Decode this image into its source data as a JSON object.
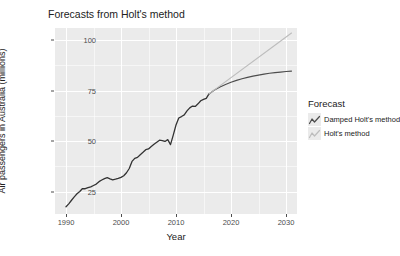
{
  "chart_data": {
    "type": "line",
    "title": "Forecasts from Holt's method",
    "xlabel": "Year",
    "ylabel": "Air passengers in Australia (millions)",
    "xlim": [
      1988,
      2032
    ],
    "ylim": [
      14,
      106
    ],
    "xticks": [
      1990,
      2000,
      2010,
      2020,
      2030
    ],
    "yticks": [
      25,
      50,
      75,
      100
    ],
    "grid": true,
    "legend_title": "Forecast",
    "legend_position": "right",
    "series": [
      {
        "name": "Historical data",
        "color": "#333333",
        "x": [
          1990,
          1990.5,
          1991,
          1991.5,
          1992,
          1992.5,
          1993,
          1993.5,
          1994,
          1994.5,
          1995,
          1995.5,
          1996,
          1996.5,
          1997,
          1997.5,
          1998,
          1998.5,
          1999,
          1999.5,
          2000,
          2000.5,
          2001,
          2001.5,
          2002,
          2002.5,
          2003,
          2003.5,
          2004,
          2004.5,
          2005,
          2005.5,
          2006,
          2006.5,
          2007,
          2007.5,
          2008,
          2008.5,
          2009,
          2009.5,
          2010,
          2010.5,
          2011,
          2011.5,
          2012,
          2012.5,
          2013,
          2013.5,
          2014,
          2014.5,
          2015,
          2015.5,
          2016
        ],
        "y": [
          17.6,
          19.0,
          20.8,
          22.5,
          24.0,
          25.1,
          26.6,
          26.5,
          27.0,
          27.4,
          28.1,
          28.8,
          30.0,
          30.8,
          31.5,
          32.0,
          31.4,
          30.9,
          31.2,
          31.6,
          32.1,
          32.9,
          34.4,
          36.5,
          40.0,
          41.5,
          42.0,
          43.3,
          44.5,
          45.8,
          46.2,
          47.4,
          48.5,
          49.5,
          50.5,
          50.3,
          49.9,
          50.8,
          48.3,
          53.0,
          58.0,
          61.5,
          62.2,
          63.0,
          65.0,
          66.5,
          67.4,
          67.2,
          68.5,
          70.0,
          70.7,
          71.2,
          73.4
        ]
      },
      {
        "name": "Damped Holt's method",
        "color": "#4d4d4d",
        "x": [
          2016,
          2017,
          2018,
          2019,
          2020,
          2021,
          2022,
          2023,
          2024,
          2025,
          2026,
          2027,
          2028,
          2029,
          2030,
          2031
        ],
        "y": [
          73.4,
          75.3,
          76.8,
          78.1,
          79.2,
          80.1,
          80.9,
          81.6,
          82.2,
          82.7,
          83.2,
          83.6,
          83.9,
          84.2,
          84.5,
          84.7
        ]
      },
      {
        "name": "Holt's method",
        "color": "#bdbdbd",
        "x": [
          2016,
          2031
        ],
        "y": [
          73.4,
          103.5
        ]
      }
    ],
    "legend_entries": [
      {
        "label": "Damped Holt's method",
        "color": "#4d4d4d"
      },
      {
        "label": "Holt's method",
        "color": "#bdbdbd"
      }
    ]
  },
  "theme": {
    "panel_background": "#ebebeb",
    "grid_color": "#ffffff",
    "text_color": "#222222",
    "tick_color": "#4d4d4d",
    "page_background": "#ffffff"
  }
}
